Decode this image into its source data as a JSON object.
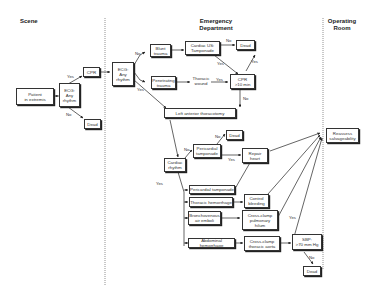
{
  "sections": {
    "scene": "Scene",
    "emergency": "Emergency\nDepartment",
    "operating": "Operating\nRoom"
  },
  "nodes": {
    "patient": "Patient\nin extremis",
    "ecg_scene": "ECG:\nAny\nrhythm",
    "cpr_scene": "CPR",
    "dead_scene": "Dead",
    "ecg_ed": "ECG:\nAny\nrhythm",
    "blunt": "Blunt\ntrauma",
    "cardiac_us": "Cardiac US:\nTamponade",
    "dead_top": "Dead",
    "penetrating": "Penetrating\ntrauma",
    "thoracic_wound": "Thoracic\nwound",
    "cpr_10": "CPR\n>10 min",
    "left_thoracotomy": "Left anterior thoracotomy",
    "cardiac_rhythm": "Cardiac\nrhythm",
    "pericardial_tamp_1": "Pericardial\ntamponade",
    "dead_mid": "Dead",
    "repair_heart": "Repair\nheart",
    "pericardial_tamp_2": "Pericardial tamponade",
    "thoracic_hemorrhage": "Thoracic hemorrhage",
    "control_bleeding": "Control\nbleeding",
    "bronchovenous": "Bronchovenous\nair emboli",
    "cross_clamp_pulm": "Cross-clamp\npulmonary\nhilum",
    "abdominal_hemorrhage": "Abdominal hemorrhage",
    "cross_clamp_aorta": "Cross-clamp\nthoracic aorta",
    "sbp": "SBP:\n>70 mm Hg",
    "dead_bottom": "Dead",
    "reassess": "Reassess\nsalvageability"
  },
  "edge_labels": {
    "ecg_scene_yes": "Yes",
    "ecg_scene_no": "No",
    "ecg_ed_no": "No",
    "ecg_ed_yes": "Yes",
    "us_no": "No",
    "us_yes": "Yes",
    "wound_yes": "Yes",
    "cpr10_yes": "Yes",
    "cpr10_no": "No",
    "rhythm_no": "No",
    "rhythm_yes": "Yes",
    "tamp_no": "No",
    "tamp_yes": "Yes",
    "sbp_yes": "Yes",
    "sbp_no": "No"
  }
}
